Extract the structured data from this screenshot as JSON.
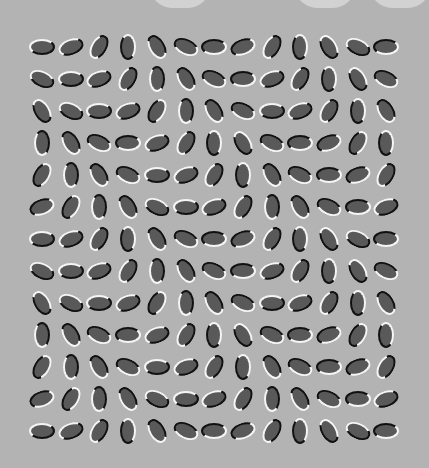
{
  "colors": {
    "background": "#b3b3b3",
    "ellipse_fill": "#595959",
    "rim_light": "#f5f5f5",
    "rim_dark": "#111111"
  },
  "grid": {
    "rows": 13,
    "cols": 13,
    "origin_x": 42,
    "origin_y": 47,
    "step_x": 28.7,
    "step_y": 32,
    "angle_sequence": [
      0,
      -20,
      -60,
      90,
      60,
      25
    ],
    "rule": "angle = angle_sequence[(col - row) mod 6]"
  }
}
